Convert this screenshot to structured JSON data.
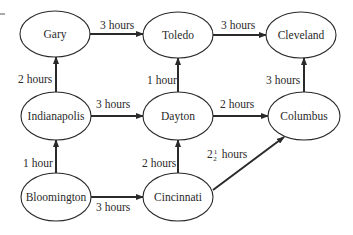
{
  "diagram": {
    "type": "directed-graph",
    "arrow_color": "#2a2a2a",
    "nodes": [
      {
        "id": "gary",
        "label": "Gary",
        "cx": 55,
        "cy": 34,
        "rx": 35,
        "ry": 23
      },
      {
        "id": "toledo",
        "label": "Toledo",
        "cx": 178,
        "cy": 35,
        "rx": 35,
        "ry": 23
      },
      {
        "id": "cleveland",
        "label": "Cleveland",
        "cx": 301,
        "cy": 35,
        "rx": 35,
        "ry": 23
      },
      {
        "id": "indianapolis",
        "label": "Indianapolis",
        "cx": 56,
        "cy": 116,
        "rx": 35,
        "ry": 24
      },
      {
        "id": "dayton",
        "label": "Dayton",
        "cx": 178,
        "cy": 116,
        "rx": 35,
        "ry": 24
      },
      {
        "id": "columbus",
        "label": "Columbus",
        "cx": 304,
        "cy": 116,
        "rx": 36,
        "ry": 24
      },
      {
        "id": "bloomington",
        "label": "Bloomington",
        "cx": 56,
        "cy": 197,
        "rx": 35,
        "ry": 24
      },
      {
        "id": "cincinnati",
        "label": "Cincinnati",
        "cx": 178,
        "cy": 197,
        "rx": 35,
        "ry": 24
      }
    ],
    "edges": [
      {
        "from": "gary",
        "to": "toledo",
        "label": "3 hours",
        "x1": 90,
        "y1": 34,
        "x2": 143,
        "y2": 34,
        "lx": 100,
        "ly": 29
      },
      {
        "from": "toledo",
        "to": "cleveland",
        "label": "3 hours",
        "x1": 213,
        "y1": 35,
        "x2": 266,
        "y2": 35,
        "lx": 221,
        "ly": 29
      },
      {
        "from": "indianapolis",
        "to": "gary",
        "label": "2 hours",
        "x1": 56,
        "y1": 92,
        "x2": 56,
        "y2": 57,
        "lx": 18,
        "ly": 83
      },
      {
        "from": "dayton",
        "to": "toledo",
        "label": "1 hour",
        "x1": 178,
        "y1": 92,
        "x2": 178,
        "y2": 58,
        "lx": 147,
        "ly": 84
      },
      {
        "from": "columbus",
        "to": "cleveland",
        "label": "3 hours",
        "x1": 304,
        "y1": 92,
        "x2": 304,
        "y2": 58,
        "lx": 266,
        "ly": 84
      },
      {
        "from": "indianapolis",
        "to": "dayton",
        "label": "3 hours",
        "x1": 91,
        "y1": 116,
        "x2": 143,
        "y2": 116,
        "lx": 96,
        "ly": 108
      },
      {
        "from": "dayton",
        "to": "columbus",
        "label": "2 hours",
        "x1": 213,
        "y1": 116,
        "x2": 268,
        "y2": 116,
        "lx": 220,
        "ly": 108
      },
      {
        "from": "bloomington",
        "to": "indianapolis",
        "label": "1 hour",
        "x1": 56,
        "y1": 173,
        "x2": 56,
        "y2": 140,
        "lx": 23,
        "ly": 167
      },
      {
        "from": "cincinnati",
        "to": "dayton",
        "label": "2 hours",
        "x1": 178,
        "y1": 173,
        "x2": 178,
        "y2": 140,
        "lx": 142,
        "ly": 167
      },
      {
        "from": "bloomington",
        "to": "cincinnati",
        "label": "3 hours",
        "x1": 91,
        "y1": 197,
        "x2": 143,
        "y2": 197,
        "lx": 96,
        "ly": 211
      },
      {
        "from": "cincinnati",
        "to": "columbus",
        "label": "2½ hours",
        "label_whole": "2",
        "label_num": "1",
        "label_den": "2",
        "label_unit": "hours",
        "x1": 213,
        "y1": 190,
        "x2": 284,
        "y2": 137,
        "lx": 207,
        "ly": 158
      }
    ]
  }
}
